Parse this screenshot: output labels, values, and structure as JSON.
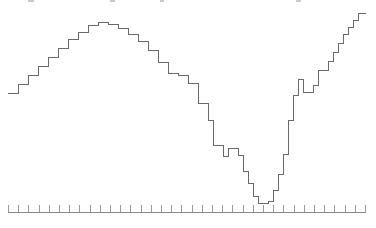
{
  "chart_title": "",
  "colors": {
    "line": "#6a6a6a",
    "axis": "#8a8a8a",
    "tick": "#9a9a9a",
    "background": "#ffffff"
  },
  "axis": {
    "baseline_y": 212,
    "x_start": 8,
    "x_end": 366,
    "tick_length": 7,
    "tick_count": 36,
    "tick_spacing": 10.2,
    "labels_visible": false
  },
  "chart_data": {
    "type": "line",
    "step_style": "step-post",
    "title": "",
    "subtitle": "",
    "xlabel": "",
    "ylabel": "",
    "grid": false,
    "legend": null,
    "legend_position": "none",
    "xlim": [
      0,
      36
    ],
    "ylim": [
      0,
      36
    ],
    "axis_tick_labels": [],
    "series": [
      {
        "name": "series-1",
        "color": "#6a6a6a",
        "x": [
          0,
          1,
          2,
          3,
          4,
          5,
          6,
          7,
          8,
          9,
          10,
          11,
          12,
          13,
          14,
          15,
          16,
          17,
          18,
          19,
          20,
          21,
          22,
          23,
          24,
          25,
          26,
          27,
          28,
          29,
          30,
          31,
          32,
          33,
          34,
          35
        ],
        "values": [
          21,
          24,
          26,
          28,
          30,
          31,
          32,
          33,
          34,
          35,
          35,
          34,
          33,
          32,
          30,
          28,
          25,
          24,
          24,
          21,
          17,
          13,
          12,
          12,
          14,
          15,
          18,
          18,
          15,
          10,
          6,
          3,
          3,
          5,
          9,
          14
        ]
      }
    ]
  },
  "plot_geometry": {
    "note": "pixel polyline of the rendered step outline",
    "points_px": [
      [
        8,
        93
      ],
      [
        18,
        93
      ],
      [
        18,
        84
      ],
      [
        28,
        84
      ],
      [
        28,
        75
      ],
      [
        38,
        75
      ],
      [
        38,
        66
      ],
      [
        48,
        66
      ],
      [
        48,
        57
      ],
      [
        58,
        57
      ],
      [
        58,
        48
      ],
      [
        68,
        48
      ],
      [
        68,
        39
      ],
      [
        78,
        39
      ],
      [
        78,
        32
      ],
      [
        88,
        32
      ],
      [
        88,
        25
      ],
      [
        98,
        25
      ],
      [
        98,
        22
      ],
      [
        108,
        22
      ],
      [
        108,
        24
      ],
      [
        118,
        24
      ],
      [
        118,
        28
      ],
      [
        128,
        28
      ],
      [
        128,
        34
      ],
      [
        138,
        34
      ],
      [
        138,
        41
      ],
      [
        148,
        41
      ],
      [
        148,
        50
      ],
      [
        158,
        50
      ],
      [
        158,
        62
      ],
      [
        168,
        62
      ],
      [
        168,
        73
      ],
      [
        178,
        73
      ],
      [
        178,
        75
      ],
      [
        188,
        75
      ],
      [
        188,
        83
      ],
      [
        198,
        83
      ],
      [
        198,
        103
      ],
      [
        208,
        103
      ],
      [
        208,
        120
      ],
      [
        213,
        120
      ],
      [
        213,
        145
      ],
      [
        223,
        145
      ],
      [
        223,
        156
      ],
      [
        228,
        156
      ],
      [
        228,
        148
      ],
      [
        238,
        148
      ],
      [
        238,
        155
      ],
      [
        243,
        155
      ],
      [
        243,
        171
      ],
      [
        248,
        171
      ],
      [
        248,
        183
      ],
      [
        253,
        183
      ],
      [
        253,
        196
      ],
      [
        258,
        196
      ],
      [
        258,
        203
      ],
      [
        268,
        203
      ],
      [
        268,
        201
      ],
      [
        273,
        201
      ],
      [
        273,
        190
      ],
      [
        278,
        190
      ],
      [
        278,
        174
      ],
      [
        283,
        174
      ],
      [
        283,
        154
      ],
      [
        288,
        154
      ],
      [
        288,
        120
      ],
      [
        293,
        120
      ],
      [
        293,
        95
      ],
      [
        298,
        95
      ],
      [
        298,
        79
      ],
      [
        303,
        79
      ],
      [
        303,
        92
      ],
      [
        313,
        92
      ],
      [
        313,
        85
      ],
      [
        318,
        85
      ],
      [
        318,
        70
      ],
      [
        328,
        70
      ],
      [
        328,
        61
      ],
      [
        333,
        61
      ],
      [
        333,
        52
      ],
      [
        338,
        52
      ],
      [
        338,
        43
      ],
      [
        343,
        43
      ],
      [
        343,
        34
      ],
      [
        348,
        34
      ],
      [
        348,
        27
      ],
      [
        353,
        27
      ],
      [
        353,
        20
      ],
      [
        358,
        20
      ],
      [
        358,
        13
      ],
      [
        366,
        13
      ]
    ]
  },
  "top_artifacts": [
    {
      "x": 28,
      "y": 0,
      "w": 6,
      "h": 2
    },
    {
      "x": 110,
      "y": 0,
      "w": 5,
      "h": 2
    },
    {
      "x": 160,
      "y": 0,
      "w": 4,
      "h": 2
    },
    {
      "x": 296,
      "y": 0,
      "w": 5,
      "h": 2
    }
  ]
}
